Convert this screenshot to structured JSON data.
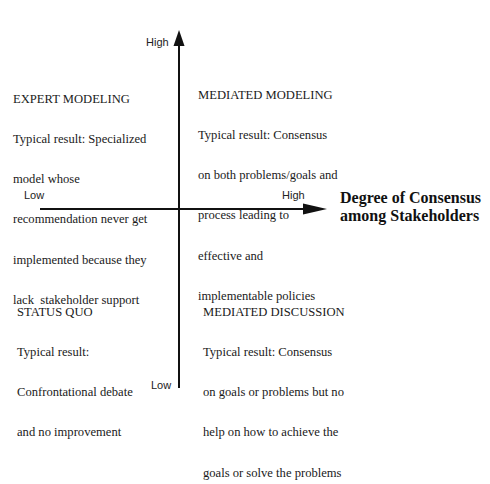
{
  "diagram": {
    "type": "quadrant",
    "colors": {
      "background": "#ffffff",
      "axis": "#111111",
      "text": "#1a1a1a"
    },
    "x_axis": {
      "low_label": "Low",
      "high_label": "High",
      "title_line1": "Degree of Consensus",
      "title_line2": "among Stakeholders"
    },
    "y_axis": {
      "low_label": "Low",
      "high_label": "High"
    },
    "quadrants": {
      "top_left": {
        "title": "EXPERT MODELING",
        "lines": [
          "Typical result: Specialized",
          "model whose",
          "recommendation never get",
          "implemented because they",
          "lack  stakeholder support"
        ]
      },
      "top_right": {
        "title": "MEDIATED MODELING",
        "lines": [
          "Typical result: Consensus",
          "on both problems/goals and",
          "process leading to",
          "effective and",
          "implementable policies"
        ]
      },
      "bottom_left": {
        "title": "STATUS QUO",
        "lines": [
          "Typical result:",
          "Confrontational debate",
          "and no improvement"
        ]
      },
      "bottom_right": {
        "title": "MEDIATED DISCUSSION",
        "lines": [
          "Typical result: Consensus",
          "on goals or problems but no",
          "help on how to achieve the",
          "goals or solve the problems"
        ]
      }
    }
  }
}
